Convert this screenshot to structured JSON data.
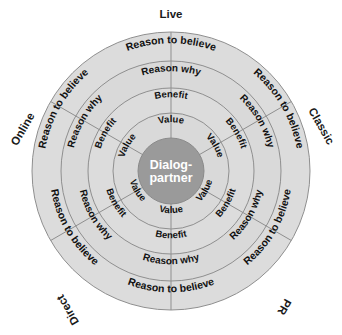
{
  "diagram": {
    "title_center": {
      "line1": "Dialog-",
      "line2": "partner"
    },
    "center_fill": "#9a9a9a",
    "ring_fill": "#d9d9d9",
    "ring_fill_alt": "#dcdcdc",
    "stroke": "#8f8f8f",
    "geometry": {
      "cx": 171,
      "cy": 171,
      "center_radius": 33,
      "ring_radii": [
        33,
        58,
        83,
        110,
        139
      ],
      "sector_count": 6,
      "sector_span_deg": 60
    },
    "ring_labels": [
      "Value",
      "Benefit",
      "Reason why",
      "Reason to believe"
    ],
    "sectors": [
      {
        "id": "live",
        "outer_label": "Live",
        "mid_angle_deg": -90,
        "rings": [
          "Value",
          "Benefit",
          "Reason why",
          "Reason to believe"
        ]
      },
      {
        "id": "classic",
        "outer_label": "Classic",
        "mid_angle_deg": -30,
        "rings": [
          "Value",
          "Benefit",
          "Reason why",
          "Reason to believe"
        ]
      },
      {
        "id": "pr",
        "outer_label": "PR",
        "mid_angle_deg": 30,
        "rings": [
          "Value",
          "Benefit",
          "Reason why",
          "Reason to believe"
        ]
      },
      {
        "id": "direct",
        "outer_label": "Direct",
        "mid_angle_deg": 90,
        "rings": [
          "Value",
          "Benefit",
          "Reason why",
          "Reason to believe"
        ]
      },
      {
        "id": "online",
        "outer_label": "Online",
        "mid_angle_deg": 210,
        "rings": [
          "Value",
          "Benefit",
          "Reason why",
          "Reason to believe"
        ]
      },
      {
        "id": "online-upper",
        "outer_label": "",
        "mid_angle_deg": 150,
        "rings": [
          "Value",
          "Benefit",
          "Reason why",
          "Reason to believe"
        ]
      }
    ],
    "outer_labels": [
      {
        "text": "Live",
        "x": 171,
        "y": 18,
        "rotate": 0
      },
      {
        "text": "Classic",
        "x": 318,
        "y": 128,
        "rotate": 60
      },
      {
        "text": "PR",
        "x": 281,
        "y": 305,
        "rotate": 120
      },
      {
        "text": "Direct",
        "x": 71,
        "y": 308,
        "rotate": -120
      },
      {
        "text": "Online",
        "x": 26,
        "y": 131,
        "rotate": -60
      }
    ]
  }
}
